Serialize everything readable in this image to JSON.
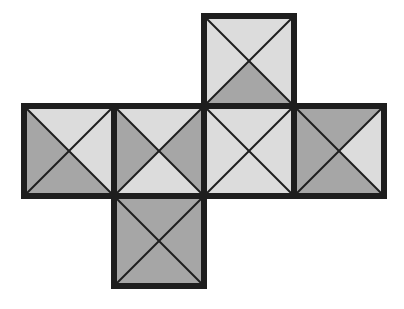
{
  "diagram": {
    "type": "cube-net",
    "colors": {
      "light": "#dcdcdc",
      "dark": "#a6a6a6",
      "border": "#1e1e1e",
      "diagonal": "#1e1e1e",
      "background": "#ffffff"
    },
    "cell_size": 90,
    "origin": [
      24,
      16
    ],
    "faces": [
      {
        "id": "top",
        "col": 2,
        "row": 0,
        "triangles": {
          "top": "light",
          "right": "light",
          "bottom": "dark",
          "left": "light"
        }
      },
      {
        "id": "left",
        "col": 0,
        "row": 1,
        "triangles": {
          "top": "light",
          "right": "light",
          "bottom": "dark",
          "left": "dark"
        }
      },
      {
        "id": "center-left",
        "col": 1,
        "row": 1,
        "triangles": {
          "top": "light",
          "right": "dark",
          "bottom": "light",
          "left": "dark"
        }
      },
      {
        "id": "center-right",
        "col": 2,
        "row": 1,
        "triangles": {
          "top": "light",
          "right": "light",
          "bottom": "light",
          "left": "light"
        }
      },
      {
        "id": "right",
        "col": 3,
        "row": 1,
        "triangles": {
          "top": "dark",
          "right": "light",
          "bottom": "dark",
          "left": "dark"
        }
      },
      {
        "id": "bottom",
        "col": 1,
        "row": 2,
        "triangles": {
          "top": "dark",
          "right": "dark",
          "bottom": "dark",
          "left": "dark"
        }
      }
    ]
  }
}
